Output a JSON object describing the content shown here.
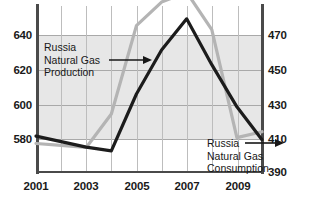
{
  "chart_data": {
    "type": "line",
    "title": "",
    "xlabel": "",
    "ylabel": "",
    "grid": true,
    "legend": "annotations",
    "x": [
      2001,
      2002,
      2003,
      2004,
      2005,
      2006,
      2007,
      2008,
      2009,
      2010
    ],
    "xtick_labels": [
      "2001",
      "2003",
      "2005",
      "2007",
      "2009"
    ],
    "xtick_values": [
      2001,
      2003,
      2005,
      2007,
      2009
    ],
    "xlim": [
      2001,
      2010
    ],
    "left_axis": {
      "label": "",
      "ylim": [
        566,
        650
      ],
      "ticks": [
        580,
        600,
        620,
        640
      ],
      "tick_labels": [
        "580",
        "600",
        "620",
        "640"
      ]
    },
    "right_axis": {
      "label": "",
      "ylim": [
        390,
        480
      ],
      "ticks": [
        390,
        410,
        430,
        450,
        470
      ],
      "tick_labels": [
        "390",
        "410",
        "430",
        "450",
        "470"
      ]
    },
    "series": [
      {
        "name": "Russia Natural Gas Production",
        "axis": "left",
        "color": "#b4b4b4",
        "values": [
          580,
          579,
          578,
          595,
          640,
          652,
          657,
          638,
          583,
          586
        ]
      },
      {
        "name": "Russia Natural Gas Consumption",
        "axis": "right",
        "color": "#1c1c1c",
        "values": [
          409,
          406,
          403,
          401,
          432,
          456,
          473,
          448,
          425,
          407
        ]
      }
    ],
    "annotations": [
      {
        "id": "production-annotation",
        "lines": [
          "Russia",
          "Natural Gas",
          "Production"
        ],
        "arrow_on_line": 2,
        "arrow_direction": "right"
      },
      {
        "id": "consumption-annotation",
        "lines": [
          "Russia",
          "Natural Gas",
          "Consumption"
        ],
        "arrow_on_line": 1,
        "arrow_direction": "right"
      }
    ],
    "colors": {
      "production_line": "#b4b4b4",
      "consumption_line": "#1c1c1c",
      "shaded_band": "#e7e7e7",
      "gridline": "#bdbdbd",
      "axis": "#4a4a4a",
      "text": "#1a1a1a",
      "background": "#ffffff"
    }
  }
}
